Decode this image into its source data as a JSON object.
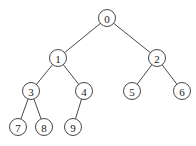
{
  "diagram": {
    "type": "binary-tree",
    "nodes": [
      {
        "id": "0",
        "label": "0",
        "x": 107,
        "y": 18
      },
      {
        "id": "1",
        "label": "1",
        "x": 58,
        "y": 58
      },
      {
        "id": "2",
        "label": "2",
        "x": 157,
        "y": 58
      },
      {
        "id": "3",
        "label": "3",
        "x": 31,
        "y": 91
      },
      {
        "id": "4",
        "label": "4",
        "x": 84,
        "y": 91
      },
      {
        "id": "5",
        "label": "5",
        "x": 132,
        "y": 91
      },
      {
        "id": "6",
        "label": "6",
        "x": 182,
        "y": 91
      },
      {
        "id": "7",
        "label": "7",
        "x": 18,
        "y": 127
      },
      {
        "id": "8",
        "label": "8",
        "x": 44,
        "y": 127
      },
      {
        "id": "9",
        "label": "9",
        "x": 73,
        "y": 127
      }
    ],
    "edges": [
      [
        "0",
        "1"
      ],
      [
        "0",
        "2"
      ],
      [
        "1",
        "3"
      ],
      [
        "1",
        "4"
      ],
      [
        "2",
        "5"
      ],
      [
        "2",
        "6"
      ],
      [
        "3",
        "7"
      ],
      [
        "3",
        "8"
      ],
      [
        "4",
        "9"
      ]
    ],
    "node_radius": 8.5
  }
}
